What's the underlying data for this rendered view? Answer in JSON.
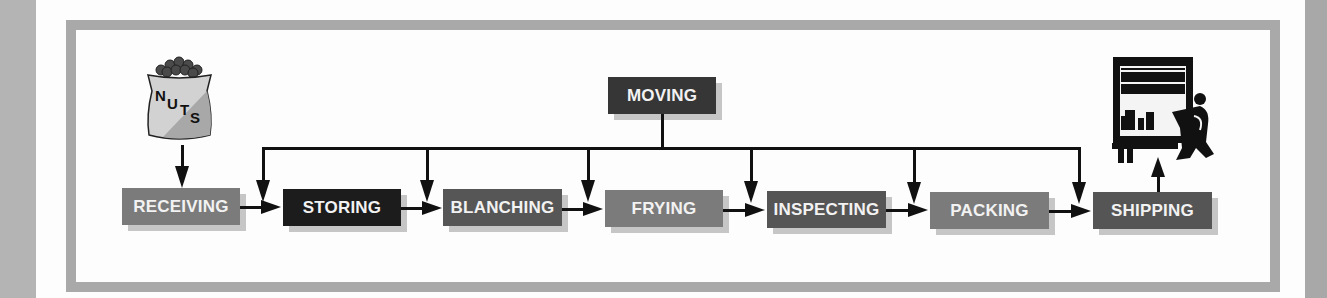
{
  "diagram": {
    "start_icon": {
      "name": "nuts-bag-icon",
      "label_letters": [
        "N",
        "U",
        "T",
        "S"
      ]
    },
    "end_icon": {
      "name": "truck-loading-icon"
    },
    "control_step": {
      "label": "MOVING",
      "color": "#363636"
    },
    "steps": [
      {
        "label": "RECEIVING",
        "color": "#7b7b7b"
      },
      {
        "label": "STORING",
        "color": "#1c1c1c"
      },
      {
        "label": "BLANCHING",
        "color": "#565656"
      },
      {
        "label": "FRYING",
        "color": "#7b7b7b"
      },
      {
        "label": "INSPECTING",
        "color": "#555555"
      },
      {
        "label": "PACKING",
        "color": "#7b7b7b"
      },
      {
        "label": "SHIPPING",
        "color": "#555555"
      }
    ],
    "frame_color": "#a9a9a9"
  }
}
